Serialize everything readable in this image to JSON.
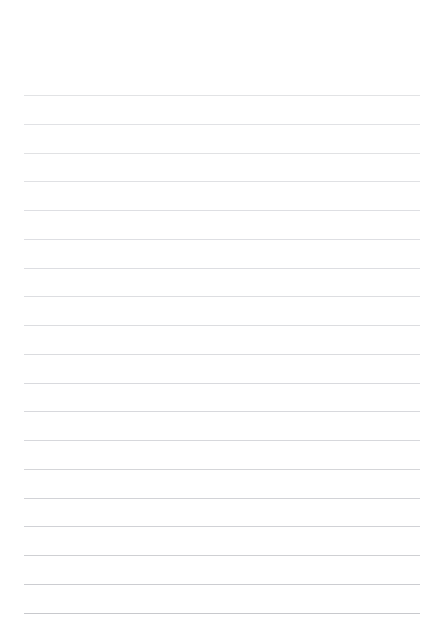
{
  "page": {
    "width": 442,
    "height": 642,
    "background_color": "#ffffff",
    "orientation": "portrait",
    "content_text": ""
  },
  "paper": {
    "type": "ruled-notebook-paper",
    "is_blank": true,
    "margins": {
      "top": 95,
      "bottom": 29,
      "left": 24,
      "right": 22
    },
    "rules": {
      "count": 19,
      "line_spacing": 28.8,
      "first_line_y": 95,
      "last_line_y": 613,
      "line_start_x": 24,
      "line_end_x": 420,
      "line_width": 396,
      "thickness": 1,
      "base_color": "#dcdde0",
      "bottom_color": "#c9cacd"
    },
    "lines": [
      {
        "index": 1,
        "y": 95,
        "color": "#dddee1",
        "opacity": 0.85
      },
      {
        "index": 2,
        "y": 124,
        "color": "#dcdde0",
        "opacity": 0.85
      },
      {
        "index": 3,
        "y": 153,
        "color": "#dcdde0",
        "opacity": 0.86
      },
      {
        "index": 4,
        "y": 181,
        "color": "#dbdce0",
        "opacity": 0.87
      },
      {
        "index": 5,
        "y": 210,
        "color": "#dadbdf",
        "opacity": 0.88
      },
      {
        "index": 6,
        "y": 239,
        "color": "#dadbdf",
        "opacity": 0.88
      },
      {
        "index": 7,
        "y": 268,
        "color": "#d9dade",
        "opacity": 0.89
      },
      {
        "index": 8,
        "y": 296,
        "color": "#d9dade",
        "opacity": 0.9
      },
      {
        "index": 9,
        "y": 325,
        "color": "#d8d9dd",
        "opacity": 0.9
      },
      {
        "index": 10,
        "y": 354,
        "color": "#d7d8dc",
        "opacity": 0.91
      },
      {
        "index": 11,
        "y": 383,
        "color": "#d6d7db",
        "opacity": 0.92
      },
      {
        "index": 12,
        "y": 411,
        "color": "#d5d6da",
        "opacity": 0.92
      },
      {
        "index": 13,
        "y": 440,
        "color": "#d4d5d9",
        "opacity": 0.93
      },
      {
        "index": 14,
        "y": 469,
        "color": "#d2d3d7",
        "opacity": 0.94
      },
      {
        "index": 15,
        "y": 498,
        "color": "#d0d1d5",
        "opacity": 0.95
      },
      {
        "index": 16,
        "y": 526,
        "color": "#cfd0d4",
        "opacity": 0.96
      },
      {
        "index": 17,
        "y": 555,
        "color": "#cdced2",
        "opacity": 0.97
      },
      {
        "index": 18,
        "y": 584,
        "color": "#cbccd0",
        "opacity": 0.98
      },
      {
        "index": 19,
        "y": 613,
        "color": "#c8c9cd",
        "opacity": 1.0
      }
    ]
  }
}
